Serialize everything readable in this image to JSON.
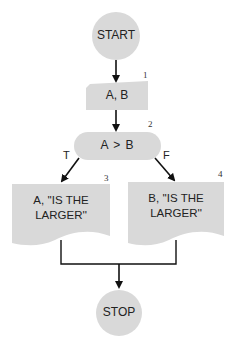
{
  "flowchart": {
    "nodes": [
      {
        "id": "start",
        "shape": "terminal-circle",
        "label": "START"
      },
      {
        "id": "1",
        "shape": "manual-input",
        "label": "A, B",
        "number": "1"
      },
      {
        "id": "2",
        "shape": "decision-pill",
        "label": "A > B",
        "number": "2"
      },
      {
        "id": "3",
        "shape": "document",
        "label_line1": "A, ''IS THE",
        "label_line2": "LARGER''",
        "number": "3"
      },
      {
        "id": "4",
        "shape": "document",
        "label_line1": "B, ''IS THE",
        "label_line2": "LARGER''",
        "number": "4"
      },
      {
        "id": "stop",
        "shape": "terminal-circle",
        "label": "STOP"
      }
    ],
    "edges": [
      {
        "from": "start",
        "to": "1",
        "label": ""
      },
      {
        "from": "1",
        "to": "2",
        "label": ""
      },
      {
        "from": "2",
        "to": "3",
        "label": "T"
      },
      {
        "from": "2",
        "to": "4",
        "label": "F"
      },
      {
        "from": "3",
        "to": "stop",
        "label": ""
      },
      {
        "from": "4",
        "to": "stop",
        "label": ""
      }
    ],
    "colors": {
      "shape_fill": "#d9d9d9",
      "line": "#111111",
      "text": "#222222"
    }
  }
}
